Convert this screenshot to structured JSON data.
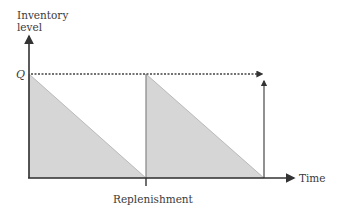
{
  "diagram": {
    "type": "inventory-sawtooth",
    "y_axis_label_line1": "Inventory",
    "y_axis_label_line2": "level",
    "x_axis_label": "Time",
    "q_label": "Q",
    "replenishment_label": "Replenishment",
    "colors": {
      "fill": "#d6d6d6",
      "axis": "#333333",
      "dotted": "#444444"
    }
  }
}
